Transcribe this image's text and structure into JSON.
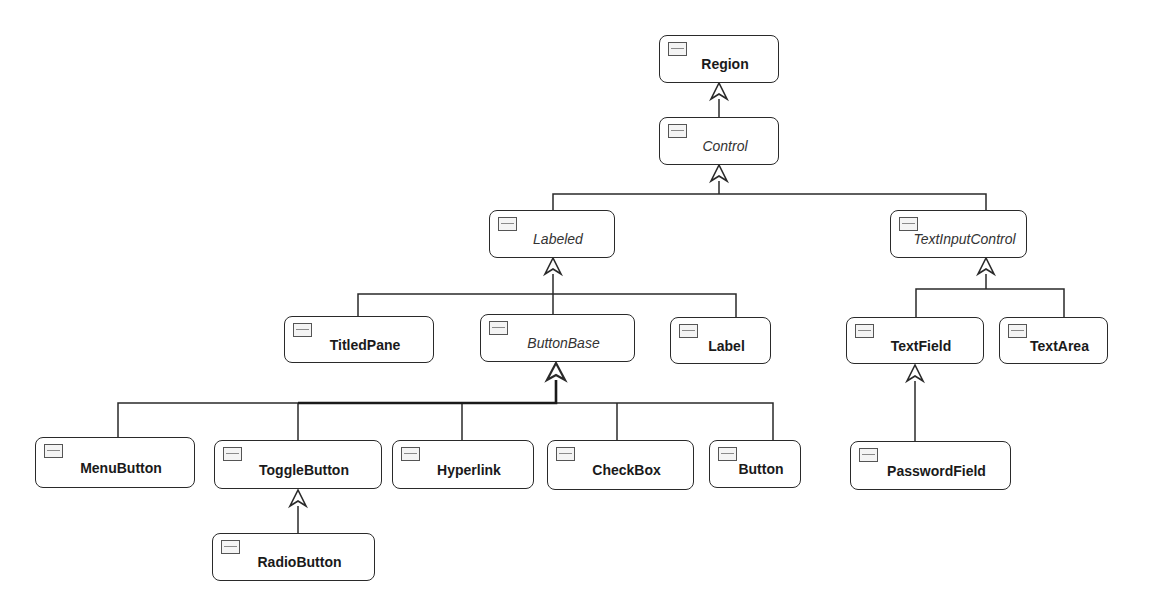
{
  "diagram": {
    "type": "uml-class-hierarchy",
    "colors": {
      "line": "#2a2a2a",
      "box_fill": "#ffffff",
      "background": "#ffffff"
    },
    "nodes": [
      {
        "id": "region",
        "label": "Region",
        "abstract": false,
        "box": [
          659,
          35,
          120,
          48
        ]
      },
      {
        "id": "control",
        "label": "Control",
        "abstract": true,
        "box": [
          659,
          117,
          120,
          48
        ]
      },
      {
        "id": "labeled",
        "label": "Labeled",
        "abstract": true,
        "box": [
          489,
          210,
          126,
          48
        ]
      },
      {
        "id": "textinputcontrol",
        "label": "TextInputControl",
        "abstract": true,
        "box": [
          890,
          210,
          137,
          48
        ]
      },
      {
        "id": "titledpane",
        "label": "TitledPane",
        "abstract": false,
        "box": [
          284,
          316,
          150,
          47
        ]
      },
      {
        "id": "buttonbase",
        "label": "ButtonBase",
        "abstract": true,
        "box": [
          480,
          314,
          155,
          48
        ]
      },
      {
        "id": "label",
        "label": "Label",
        "abstract": false,
        "box": [
          670,
          317,
          101,
          47
        ]
      },
      {
        "id": "textfield",
        "label": "TextField",
        "abstract": false,
        "box": [
          846,
          317,
          138,
          47
        ]
      },
      {
        "id": "textarea",
        "label": "TextArea",
        "abstract": false,
        "box": [
          999,
          317,
          109,
          47
        ]
      },
      {
        "id": "menubutton",
        "label": "MenuButton",
        "abstract": false,
        "box": [
          35,
          437,
          160,
          51
        ]
      },
      {
        "id": "togglebutton",
        "label": "ToggleButton",
        "abstract": false,
        "box": [
          214,
          440,
          168,
          49
        ]
      },
      {
        "id": "hyperlink",
        "label": "Hyperlink",
        "abstract": false,
        "box": [
          392,
          440,
          142,
          49
        ]
      },
      {
        "id": "checkbox",
        "label": "CheckBox",
        "abstract": false,
        "box": [
          547,
          440,
          147,
          50
        ]
      },
      {
        "id": "button",
        "label": "Button",
        "abstract": false,
        "box": [
          709,
          440,
          92,
          48
        ]
      },
      {
        "id": "passwordfield",
        "label": "PasswordField",
        "abstract": false,
        "box": [
          850,
          441,
          161,
          49
        ]
      },
      {
        "id": "radiobutton",
        "label": "RadioButton",
        "abstract": false,
        "box": [
          212,
          533,
          163,
          48
        ]
      }
    ],
    "inheritance": [
      {
        "parent": "Region",
        "children": [
          "Control"
        ]
      },
      {
        "parent": "Control",
        "children": [
          "Labeled",
          "TextInputControl"
        ]
      },
      {
        "parent": "Labeled",
        "children": [
          "TitledPane",
          "ButtonBase",
          "Label"
        ]
      },
      {
        "parent": "TextInputControl",
        "children": [
          "TextField",
          "TextArea"
        ]
      },
      {
        "parent": "ButtonBase",
        "children": [
          "MenuButton",
          "ToggleButton",
          "Hyperlink",
          "CheckBox",
          "Button"
        ]
      },
      {
        "parent": "ToggleButton",
        "children": [
          "RadioButton"
        ]
      },
      {
        "parent": "TextField",
        "children": [
          "PasswordField"
        ]
      }
    ],
    "icon": "class-icon"
  }
}
